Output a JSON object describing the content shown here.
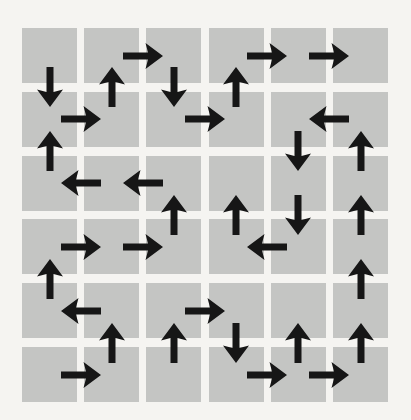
{
  "figure": {
    "grid": {
      "columns": 6,
      "rows": 6,
      "origin_x": 22,
      "origin_y": 28,
      "square_size": 55,
      "pitch_x": 62.2,
      "pitch_y": 63.8
    },
    "colors": {
      "background": "#f5f4f1",
      "square": "#c4c5c3",
      "arrow": "#161616"
    },
    "arrow_shape": {
      "total_length": 40,
      "shaft_thickness": 7,
      "head_width": 26,
      "head_length": 17.5
    },
    "arrows": [
      {
        "x": 142.8,
        "y": 55.5,
        "dir": "right"
      },
      {
        "x": 267.2,
        "y": 55.5,
        "dir": "right"
      },
      {
        "x": 329.4,
        "y": 55.5,
        "dir": "right"
      },
      {
        "x": 49.5,
        "y": 87.4,
        "dir": "down"
      },
      {
        "x": 111.7,
        "y": 87.4,
        "dir": "up"
      },
      {
        "x": 173.9,
        "y": 87.4,
        "dir": "down"
      },
      {
        "x": 236.1,
        "y": 87.4,
        "dir": "up"
      },
      {
        "x": 80.6,
        "y": 119.3,
        "dir": "right"
      },
      {
        "x": 205.0,
        "y": 119.3,
        "dir": "right"
      },
      {
        "x": 329.4,
        "y": 119.3,
        "dir": "left"
      },
      {
        "x": 49.5,
        "y": 151.2,
        "dir": "up"
      },
      {
        "x": 298.3,
        "y": 151.2,
        "dir": "down"
      },
      {
        "x": 360.5,
        "y": 151.2,
        "dir": "up"
      },
      {
        "x": 80.6,
        "y": 183.1,
        "dir": "left"
      },
      {
        "x": 142.8,
        "y": 183.1,
        "dir": "left"
      },
      {
        "x": 173.9,
        "y": 215.0,
        "dir": "up"
      },
      {
        "x": 236.1,
        "y": 215.0,
        "dir": "up"
      },
      {
        "x": 298.3,
        "y": 215.0,
        "dir": "down"
      },
      {
        "x": 360.5,
        "y": 215.0,
        "dir": "up"
      },
      {
        "x": 80.6,
        "y": 246.9,
        "dir": "right"
      },
      {
        "x": 142.8,
        "y": 246.9,
        "dir": "right"
      },
      {
        "x": 267.2,
        "y": 246.9,
        "dir": "left"
      },
      {
        "x": 49.5,
        "y": 278.8,
        "dir": "up"
      },
      {
        "x": 360.5,
        "y": 278.8,
        "dir": "up"
      },
      {
        "x": 80.6,
        "y": 310.7,
        "dir": "left"
      },
      {
        "x": 205.0,
        "y": 310.7,
        "dir": "right"
      },
      {
        "x": 111.7,
        "y": 342.6,
        "dir": "up"
      },
      {
        "x": 173.9,
        "y": 342.6,
        "dir": "up"
      },
      {
        "x": 236.1,
        "y": 342.6,
        "dir": "down"
      },
      {
        "x": 298.3,
        "y": 342.6,
        "dir": "up"
      },
      {
        "x": 360.5,
        "y": 342.6,
        "dir": "up"
      },
      {
        "x": 80.6,
        "y": 374.5,
        "dir": "right"
      },
      {
        "x": 267.2,
        "y": 374.5,
        "dir": "right"
      },
      {
        "x": 329.4,
        "y": 374.5,
        "dir": "right"
      }
    ]
  }
}
